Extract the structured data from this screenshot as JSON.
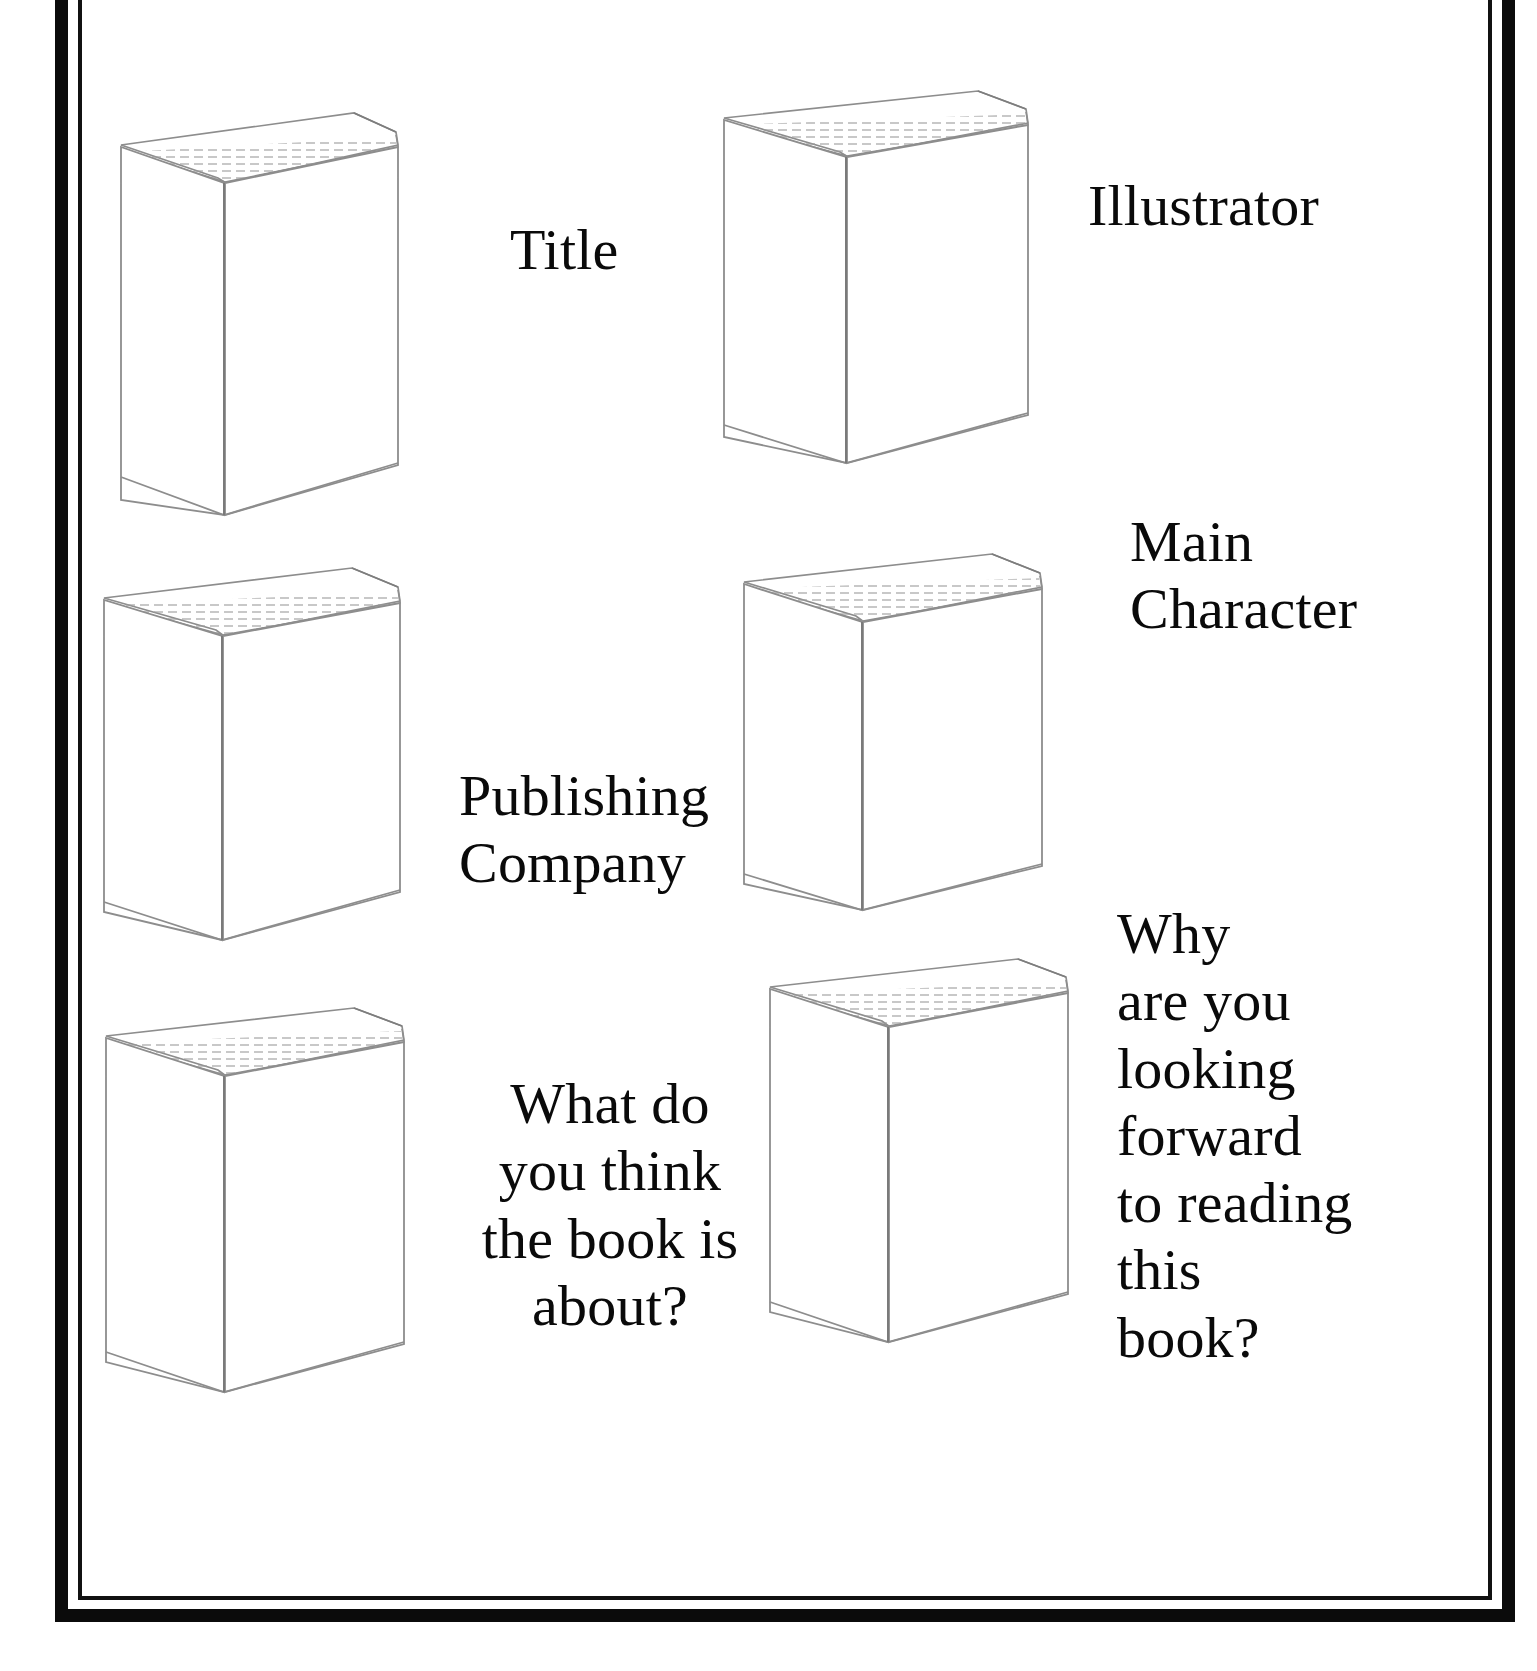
{
  "worksheet": {
    "title": "Book Report Prediction Worksheet",
    "background_color": "#ffffff",
    "ink_color": "#0a0a0a",
    "frame": {
      "outer_border_color": "#0b0b0b",
      "inner_border_color": "#111111"
    }
  },
  "books": [
    {
      "id": "book-1",
      "position": "top-left",
      "icon": "book-3d-icon"
    },
    {
      "id": "book-2",
      "position": "top-right",
      "icon": "book-3d-icon"
    },
    {
      "id": "book-3",
      "position": "middle-left",
      "icon": "book-3d-icon"
    },
    {
      "id": "book-4",
      "position": "middle-right",
      "icon": "book-3d-icon"
    },
    {
      "id": "book-5",
      "position": "bottom-left",
      "icon": "book-3d-icon"
    },
    {
      "id": "book-6",
      "position": "bottom-right",
      "icon": "book-3d-icon"
    }
  ],
  "prompts": [
    {
      "id": "prompt-title",
      "text": "Title",
      "align": "left",
      "font_size_px": 58
    },
    {
      "id": "prompt-illustrator",
      "text": "Illustrator",
      "align": "left",
      "font_size_px": 58
    },
    {
      "id": "prompt-publishing-company",
      "text": "Publishing\nCompany",
      "align": "left",
      "font_size_px": 58
    },
    {
      "id": "prompt-main-character",
      "text": "Main\nCharacter",
      "align": "left",
      "font_size_px": 58
    },
    {
      "id": "prompt-what-is-book-about",
      "text": "What do\nyou think\nthe book is\nabout?",
      "align": "center",
      "font_size_px": 58
    },
    {
      "id": "prompt-why-looking-forward",
      "text": "Why\nare you\nlooking\nforward\nto reading\nthis\nbook?",
      "align": "left",
      "font_size_px": 58
    }
  ]
}
